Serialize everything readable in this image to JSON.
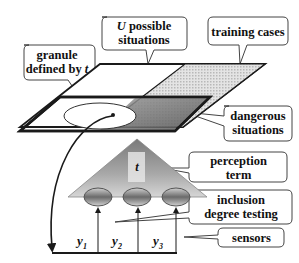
{
  "diagram": {
    "callouts": {
      "possible_situations": {
        "var": "U",
        "text": " possible",
        "line2": "situations"
      },
      "training_cases": {
        "text": "training cases"
      },
      "granule": {
        "line1": "granule",
        "line2": "defined by ",
        "var": "t"
      },
      "dangerous": {
        "line1": "dangerous",
        "line2": "situations"
      },
      "perception": {
        "line1": "perception",
        "line2": "term"
      },
      "inclusion": {
        "line1": "inclusion",
        "line2": "degree testing"
      },
      "sensors": {
        "text": "sensors"
      }
    },
    "term_label": "t",
    "sensor_labels": [
      "y",
      "y",
      "y"
    ],
    "sensor_subscripts": [
      "1",
      "2",
      "3"
    ],
    "colors": {
      "stroke": "#1a1a1a",
      "hatch": "#bdbdbd",
      "dark": "#6e6e6e",
      "background": "#ffffff"
    }
  }
}
